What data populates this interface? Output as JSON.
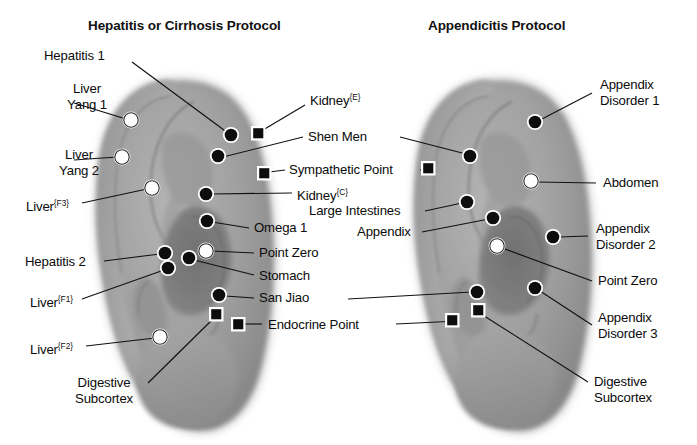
{
  "figure": {
    "kind": "auricular-acupuncture-point-chart",
    "background_color": "#ffffff",
    "marker_styles": {
      "filled_circle": {
        "fill": "#0d0d0d",
        "ring": "#ffffff",
        "meaning": "primary point"
      },
      "open_circle": {
        "fill": "#ffffff",
        "ring": "#ffffff",
        "stroke": "#1a1a1a",
        "meaning": "secondary point"
      },
      "filled_square": {
        "fill": "#0d0d0d",
        "ring": "#ffffff",
        "meaning": "master point"
      }
    },
    "leader_line_color": "#111111"
  },
  "panels": [
    {
      "id": "left",
      "title": "Hepatitis or Cirrhosis Protocol",
      "ear_side": "left-ear-photograph"
    },
    {
      "id": "right",
      "title": "Appendicitis Protocol",
      "ear_side": "left-ear-photograph"
    }
  ],
  "labels": {
    "left_panel": [
      {
        "key": "hepatitis-1",
        "text": "Hepatitis 1",
        "sup": "",
        "align": "left",
        "lines": 1
      },
      {
        "key": "liver-yang-1",
        "text": "Liver",
        "line2": "Yang 1",
        "sup": "",
        "align": "left",
        "lines": 2
      },
      {
        "key": "liver-yang-2",
        "text": "Liver",
        "line2": "Yang 2",
        "sup": "",
        "align": "left",
        "lines": 2
      },
      {
        "key": "liver-f3",
        "text": "Liver",
        "sup": "{F3}",
        "align": "left",
        "lines": 1
      },
      {
        "key": "hepatitis-2",
        "text": "Hepatitis 2",
        "sup": "",
        "align": "left",
        "lines": 1
      },
      {
        "key": "liver-f1",
        "text": "Liver",
        "sup": "{F1}",
        "align": "left",
        "lines": 1
      },
      {
        "key": "liver-f2",
        "text": "Liver",
        "sup": "{F2}",
        "align": "left",
        "lines": 1
      },
      {
        "key": "digestive-subcortex-left",
        "text": "Digestive",
        "line2": "Subcortex",
        "sup": "",
        "align": "left",
        "lines": 2
      }
    ],
    "center_column": [
      {
        "key": "kidney-e",
        "text": "Kidney",
        "sup": "{E}",
        "serves": "left"
      },
      {
        "key": "shen-men",
        "text": "Shen Men",
        "sup": "",
        "serves": "both"
      },
      {
        "key": "sympathetic-point",
        "text": "Sympathetic Point",
        "sup": "",
        "serves": "both"
      },
      {
        "key": "kidney-c",
        "text": "Kidney",
        "sup": "{C}",
        "serves": "left"
      },
      {
        "key": "large-intestines",
        "text": "Large Intestines",
        "sup": "",
        "serves": "right"
      },
      {
        "key": "omega-1",
        "text": "Omega 1",
        "sup": "",
        "serves": "left"
      },
      {
        "key": "appendix",
        "text": "Appendix",
        "sup": "",
        "serves": "right"
      },
      {
        "key": "point-zero-left",
        "text": "Point Zero",
        "sup": "",
        "serves": "left"
      },
      {
        "key": "stomach",
        "text": "Stomach",
        "sup": "",
        "serves": "left"
      },
      {
        "key": "san-jiao",
        "text": "San Jiao",
        "sup": "",
        "serves": "both"
      },
      {
        "key": "endocrine-point",
        "text": "Endocrine Point",
        "sup": "",
        "serves": "both"
      }
    ],
    "right_panel": [
      {
        "key": "appendix-disorder-1",
        "text": "Appendix",
        "line2": "Disorder 1",
        "sup": "",
        "align": "left",
        "lines": 2
      },
      {
        "key": "abdomen",
        "text": "Abdomen",
        "sup": "",
        "align": "left",
        "lines": 1
      },
      {
        "key": "appendix-disorder-2",
        "text": "Appendix",
        "line2": "Disorder 2",
        "sup": "",
        "align": "left",
        "lines": 2
      },
      {
        "key": "point-zero-right",
        "text": "Point Zero",
        "sup": "",
        "align": "left",
        "lines": 1
      },
      {
        "key": "appendix-disorder-3",
        "text": "Appendix",
        "line2": "Disorder 3",
        "sup": "",
        "align": "left",
        "lines": 2
      },
      {
        "key": "digestive-subcortex-right",
        "text": "Digestive",
        "line2": "Subcortex",
        "sup": "",
        "align": "left",
        "lines": 2
      }
    ]
  },
  "text": {
    "title_left": "Hepatitis or Cirrhosis Protocol",
    "title_right": "Appendicitis Protocol",
    "hepatitis_1": "Hepatitis 1",
    "liver": "Liver",
    "yang_1": "Yang 1",
    "yang_2": "Yang 2",
    "sup_f3": "{F3}",
    "sup_f1": "{F1}",
    "sup_f2": "{F2}",
    "sup_e": "{E}",
    "sup_c": "{C}",
    "hepatitis_2": "Hepatitis 2",
    "digestive": "Digestive",
    "subcortex": "Subcortex",
    "kidney": "Kidney",
    "shen_men": "Shen Men",
    "sympathetic_point": "Sympathetic Point",
    "large_intestines": "Large Intestines",
    "omega_1": "Omega 1",
    "appendix": "Appendix",
    "point_zero": "Point Zero",
    "stomach": "Stomach",
    "san_jiao": "San Jiao",
    "endocrine_point": "Endocrine Point",
    "appendix_word": "Appendix",
    "disorder_1": "Disorder 1",
    "disorder_2": "Disorder 2",
    "disorder_3": "Disorder 3",
    "abdomen": "Abdomen"
  },
  "points": {
    "left_panel": [
      {
        "name": "liver-yang-1",
        "shape": "open_circle",
        "x": 131,
        "y": 120
      },
      {
        "name": "liver-yang-2",
        "shape": "open_circle",
        "x": 122,
        "y": 157
      },
      {
        "name": "liver-f3",
        "shape": "open_circle",
        "x": 152,
        "y": 188
      },
      {
        "name": "hepatitis-1",
        "shape": "filled_circle",
        "x": 231,
        "y": 135
      },
      {
        "name": "kidney-e",
        "shape": "filled_square",
        "x": 258,
        "y": 133
      },
      {
        "name": "shen-men",
        "shape": "filled_circle",
        "x": 218,
        "y": 156
      },
      {
        "name": "sympathetic-point",
        "shape": "filled_square",
        "x": 264,
        "y": 173
      },
      {
        "name": "kidney-c",
        "shape": "filled_circle",
        "x": 206,
        "y": 194
      },
      {
        "name": "omega-1",
        "shape": "filled_circle",
        "x": 207,
        "y": 221
      },
      {
        "name": "hepatitis-2",
        "shape": "filled_circle",
        "x": 165,
        "y": 253
      },
      {
        "name": "liver-f1",
        "shape": "filled_circle",
        "x": 168,
        "y": 268
      },
      {
        "name": "stomach",
        "shape": "filled_circle",
        "x": 189,
        "y": 258
      },
      {
        "name": "point-zero",
        "shape": "open_circle",
        "x": 206,
        "y": 251
      },
      {
        "name": "san-jiao",
        "shape": "filled_circle",
        "x": 219,
        "y": 295
      },
      {
        "name": "digestive-subcortex",
        "shape": "filled_square",
        "x": 216,
        "y": 314
      },
      {
        "name": "endocrine-point",
        "shape": "filled_square",
        "x": 238,
        "y": 324
      },
      {
        "name": "liver-f2",
        "shape": "open_circle",
        "x": 160,
        "y": 337
      }
    ],
    "right_panel": [
      {
        "name": "appendix-disorder-1",
        "shape": "filled_circle",
        "x": 535,
        "y": 122
      },
      {
        "name": "shen-men",
        "shape": "filled_circle",
        "x": 470,
        "y": 156
      },
      {
        "name": "sympathetic-point",
        "shape": "filled_square",
        "x": 428,
        "y": 168
      },
      {
        "name": "abdomen",
        "shape": "open_circle",
        "x": 531,
        "y": 181
      },
      {
        "name": "large-intestines",
        "shape": "filled_circle",
        "x": 467,
        "y": 202
      },
      {
        "name": "appendix",
        "shape": "filled_circle",
        "x": 493,
        "y": 218
      },
      {
        "name": "appendix-disorder-2",
        "shape": "filled_circle",
        "x": 553,
        "y": 237
      },
      {
        "name": "point-zero",
        "shape": "open_circle",
        "x": 497,
        "y": 246
      },
      {
        "name": "appendix-disorder-3",
        "shape": "filled_circle",
        "x": 535,
        "y": 288
      },
      {
        "name": "san-jiao",
        "shape": "filled_circle",
        "x": 477,
        "y": 292
      },
      {
        "name": "digestive-subcortex",
        "shape": "filled_square",
        "x": 478,
        "y": 310
      },
      {
        "name": "endocrine-point",
        "shape": "filled_square",
        "x": 452,
        "y": 320
      }
    ]
  }
}
